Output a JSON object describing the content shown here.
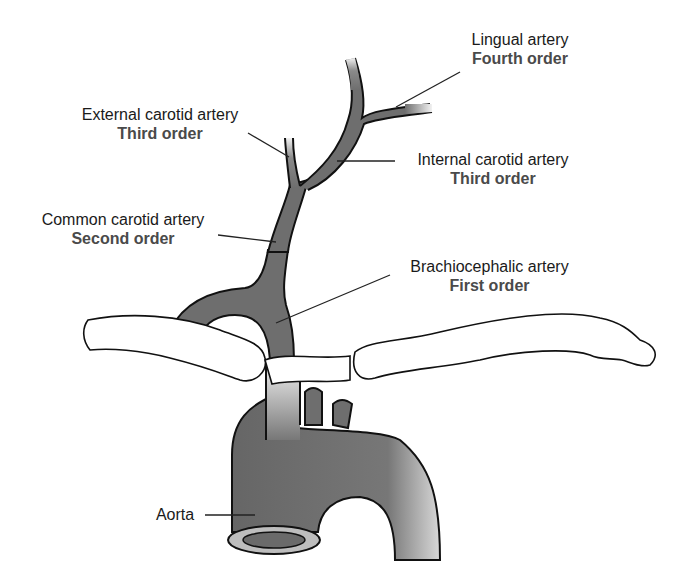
{
  "diagram": {
    "labels": {
      "lingual": {
        "name": "Lingual artery",
        "order": "Fourth order"
      },
      "external_carotid": {
        "name": "External carotid artery",
        "order": "Third order"
      },
      "internal_carotid": {
        "name": "Internal carotid artery",
        "order": "Third order"
      },
      "common_carotid": {
        "name": "Common carotid artery",
        "order": "Second order"
      },
      "brachiocephalic": {
        "name": "Brachiocephalic artery",
        "order": "First order"
      },
      "aorta": {
        "name": "Aorta"
      }
    },
    "colors": {
      "vessel": "#6e6e6e",
      "outline": "#111111",
      "bone": "#ffffff",
      "leader": "#222222"
    }
  }
}
